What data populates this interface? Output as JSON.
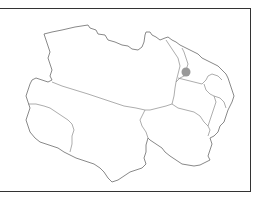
{
  "map": {
    "region": "Qinghai Province",
    "frame_color": "#333333",
    "boundary_color": "#7a7a7a",
    "marker": {
      "cx": 186,
      "cy": 72,
      "r": 4.5,
      "color": "#999999"
    }
  }
}
